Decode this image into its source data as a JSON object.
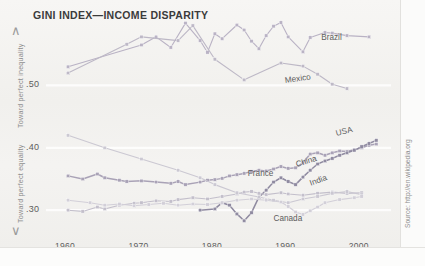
{
  "title": "GINI INDEX—INCOME DISPARITY",
  "axis": {
    "y_caption_top": "Toward perfect inequality",
    "y_caption_bottom": "Toward perfect equality",
    "caret_up": "∧",
    "caret_down": "∨"
  },
  "source": "Source: http://en.wikipedia.org",
  "chart_data": {
    "type": "line",
    "title": "GINI INDEX—INCOME DISPARITY",
    "xlabel": "",
    "ylabel": "Gini index",
    "xlim": [
      1957,
      2004
    ],
    "ylim": [
      0.265,
      0.605
    ],
    "xticks": [
      1960,
      1970,
      1980,
      1990,
      2000
    ],
    "xtick_labels": [
      "1960",
      "1970",
      "1980",
      "1990",
      "2000"
    ],
    "yticks": [
      0.5,
      0.4,
      0.3
    ],
    "ytick_labels": [
      ".50",
      ".40",
      ".30"
    ],
    "grid": "horizontal-light",
    "legend": "inline-labels",
    "annotations": [
      "Toward perfect inequality",
      "Toward perfect equality",
      "Source: http://en.wikipedia.org"
    ],
    "series": [
      {
        "name": "Brazil",
        "color": "#b9b2c4",
        "label_x": 1994.5,
        "label_y": 0.577,
        "points": [
          [
            1960,
            0.53
          ],
          [
            1970,
            0.565
          ],
          [
            1972,
            0.578
          ],
          [
            1974,
            0.561
          ],
          [
            1976,
            0.6
          ],
          [
            1978,
            0.572
          ],
          [
            1979,
            0.553
          ],
          [
            1980,
            0.583
          ],
          [
            1981,
            0.575
          ],
          [
            1983,
            0.597
          ],
          [
            1984,
            0.589
          ],
          [
            1985,
            0.571
          ],
          [
            1986,
            0.559
          ],
          [
            1987,
            0.58
          ],
          [
            1988,
            0.595
          ],
          [
            1989,
            0.601
          ],
          [
            1990,
            0.578
          ],
          [
            1992,
            0.554
          ],
          [
            1993,
            0.577
          ],
          [
            1995,
            0.585
          ],
          [
            1996,
            0.584
          ],
          [
            1998,
            0.58
          ],
          [
            2001,
            0.578
          ]
        ]
      },
      {
        "name": "Mexico",
        "color": "#bdb8c6",
        "label_x": 1989.5,
        "label_y": 0.508,
        "points": [
          [
            1960,
            0.52
          ],
          [
            1968,
            0.566
          ],
          [
            1970,
            0.578
          ],
          [
            1975,
            0.572
          ],
          [
            1977,
            0.596
          ],
          [
            1980,
            0.542
          ],
          [
            1984,
            0.509
          ],
          [
            1989,
            0.536
          ],
          [
            1992,
            0.531
          ],
          [
            1994,
            0.518
          ],
          [
            1996,
            0.502
          ],
          [
            1998,
            0.495
          ]
        ]
      },
      {
        "name": "USA",
        "color": "#a9a2b6",
        "label_x": 1996.5,
        "label_y": 0.424,
        "points": [
          [
            1960,
            0.355
          ],
          [
            1962,
            0.35
          ],
          [
            1964,
            0.358
          ],
          [
            1965,
            0.352
          ],
          [
            1967,
            0.348
          ],
          [
            1968,
            0.346
          ],
          [
            1970,
            0.347
          ],
          [
            1972,
            0.345
          ],
          [
            1974,
            0.343
          ],
          [
            1975,
            0.346
          ],
          [
            1976,
            0.341
          ],
          [
            1978,
            0.345
          ],
          [
            1979,
            0.348
          ],
          [
            1980,
            0.349
          ],
          [
            1981,
            0.351
          ],
          [
            1982,
            0.355
          ],
          [
            1983,
            0.357
          ],
          [
            1984,
            0.359
          ],
          [
            1985,
            0.362
          ],
          [
            1986,
            0.364
          ],
          [
            1987,
            0.363
          ],
          [
            1988,
            0.366
          ],
          [
            1989,
            0.37
          ],
          [
            1990,
            0.367
          ],
          [
            1991,
            0.368
          ],
          [
            1992,
            0.376
          ],
          [
            1993,
            0.39
          ],
          [
            1994,
            0.392
          ],
          [
            1995,
            0.388
          ],
          [
            1996,
            0.392
          ],
          [
            1997,
            0.395
          ],
          [
            1998,
            0.394
          ],
          [
            1999,
            0.397
          ],
          [
            2000,
            0.4
          ],
          [
            2001,
            0.404
          ],
          [
            2002,
            0.406
          ]
        ]
      },
      {
        "name": "China",
        "color": "#8f8aa0",
        "label_x": 1991.0,
        "label_y": 0.374,
        "points": [
          [
            1978,
            0.3
          ],
          [
            1980,
            0.302
          ],
          [
            1981,
            0.312
          ],
          [
            1982,
            0.308
          ],
          [
            1983,
            0.294
          ],
          [
            1984,
            0.283
          ],
          [
            1985,
            0.296
          ],
          [
            1986,
            0.321
          ],
          [
            1987,
            0.332
          ],
          [
            1988,
            0.345
          ],
          [
            1989,
            0.352
          ],
          [
            1990,
            0.346
          ],
          [
            1991,
            0.341
          ],
          [
            1992,
            0.353
          ],
          [
            1993,
            0.364
          ],
          [
            1994,
            0.374
          ],
          [
            1995,
            0.379
          ],
          [
            1996,
            0.383
          ],
          [
            1997,
            0.388
          ],
          [
            1998,
            0.392
          ],
          [
            1999,
            0.396
          ],
          [
            2000,
            0.402
          ],
          [
            2001,
            0.407
          ],
          [
            2002,
            0.412
          ]
        ]
      },
      {
        "name": "France",
        "color": "#c3bfcb",
        "label_x": 1984.5,
        "label_y": 0.36,
        "points": [
          [
            1960,
            0.3
          ],
          [
            1962,
            0.298
          ],
          [
            1964,
            0.305
          ],
          [
            1965,
            0.302
          ],
          [
            1967,
            0.308
          ],
          [
            1969,
            0.311
          ],
          [
            1970,
            0.312
          ],
          [
            1972,
            0.315
          ],
          [
            1974,
            0.314
          ],
          [
            1975,
            0.317
          ],
          [
            1977,
            0.32
          ],
          [
            1979,
            0.318
          ],
          [
            1981,
            0.322
          ],
          [
            1983,
            0.326
          ],
          [
            1984,
            0.329
          ],
          [
            1985,
            0.33
          ],
          [
            1986,
            0.327
          ],
          [
            1987,
            0.325
          ],
          [
            1989,
            0.328
          ],
          [
            1990,
            0.326
          ],
          [
            1992,
            0.324
          ],
          [
            1994,
            0.327
          ],
          [
            1996,
            0.329
          ],
          [
            1998,
            0.327
          ],
          [
            2000,
            0.328
          ]
        ]
      },
      {
        "name": "India",
        "color": "#cbc8d2",
        "label_x": 1993.0,
        "label_y": 0.343,
        "points": [
          [
            1960,
            0.42
          ],
          [
            1965,
            0.4
          ],
          [
            1970,
            0.382
          ],
          [
            1975,
            0.364
          ],
          [
            1978,
            0.352
          ],
          [
            1980,
            0.341
          ],
          [
            1983,
            0.328
          ],
          [
            1986,
            0.321
          ],
          [
            1988,
            0.316
          ],
          [
            1990,
            0.312
          ],
          [
            1992,
            0.318
          ],
          [
            1994,
            0.322
          ],
          [
            1996,
            0.327
          ],
          [
            1998,
            0.33
          ],
          [
            2000,
            0.325
          ]
        ]
      },
      {
        "name": "Canada",
        "color": "#d2cfd8",
        "label_x": 1988.0,
        "label_y": 0.288,
        "points": [
          [
            1960,
            0.316
          ],
          [
            1963,
            0.312
          ],
          [
            1965,
            0.308
          ],
          [
            1967,
            0.31
          ],
          [
            1969,
            0.307
          ],
          [
            1971,
            0.309
          ],
          [
            1973,
            0.311
          ],
          [
            1975,
            0.308
          ],
          [
            1977,
            0.31
          ],
          [
            1979,
            0.309
          ],
          [
            1981,
            0.312
          ],
          [
            1983,
            0.316
          ],
          [
            1985,
            0.318
          ],
          [
            1987,
            0.316
          ],
          [
            1989,
            0.313
          ],
          [
            1990,
            0.306
          ],
          [
            1991,
            0.297
          ],
          [
            1992,
            0.293
          ],
          [
            1993,
            0.299
          ],
          [
            1994,
            0.305
          ],
          [
            1995,
            0.312
          ],
          [
            1997,
            0.317
          ],
          [
            1999,
            0.32
          ],
          [
            2000,
            0.322
          ]
        ]
      }
    ]
  }
}
